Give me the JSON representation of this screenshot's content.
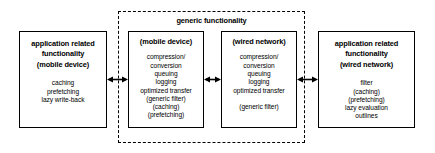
{
  "diagram": {
    "group": {
      "label": "generic functionality"
    },
    "boxes": {
      "app_mobile": {
        "title_line1": "application related",
        "title_line2": "functionality",
        "subtitle": "(mobile device)",
        "items": [
          "caching",
          "prefetching",
          "lazy write-back"
        ]
      },
      "generic_mobile": {
        "subtitle": "(mobile device)",
        "items": [
          "compression/",
          "conversion",
          "queuing",
          "logging",
          "optimized transfer",
          "(generic filter)",
          "(caching)",
          "(prefetching)"
        ]
      },
      "generic_wired": {
        "subtitle": "(wired network)",
        "items": [
          "compression/",
          "conversion",
          "queuing",
          "logging",
          "optimized transfer",
          "",
          "(generic filter)"
        ]
      },
      "app_wired": {
        "title_line1": "application related",
        "title_line2": "functionality",
        "subtitle": "(wired network)",
        "items": [
          "filter",
          "(caching)",
          "(prefetching)",
          "lazy evaluation",
          "outlines"
        ]
      }
    },
    "connectors": [
      {
        "name": "connector-app-mobile-to-generic-mobile",
        "kind": "double-arrow"
      },
      {
        "name": "connector-generic-mobile-to-generic-wired",
        "kind": "double-arrow"
      },
      {
        "name": "connector-generic-wired-to-app-wired",
        "kind": "double-arrow"
      }
    ],
    "colors": {
      "background": "#ffffff",
      "stroke": "#000000",
      "text": "#000000"
    }
  }
}
